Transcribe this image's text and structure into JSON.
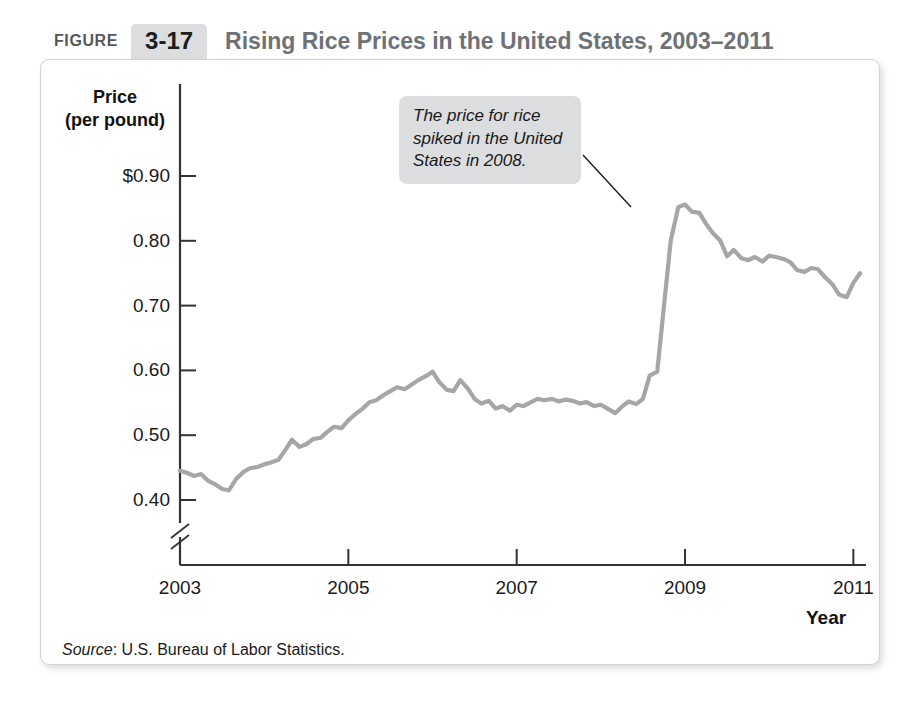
{
  "figure": {
    "label": "FIGURE",
    "number": "3-17",
    "title": "Rising Rice Prices in the United States, 2003–2011"
  },
  "source": {
    "prefix": "Source",
    "text": ": U.S. Bureau of Labor Statistics."
  },
  "annotation": {
    "text": "The price for rice spiked in the United States in 2008."
  },
  "colors": {
    "line": "#a6a6a6",
    "axis": "#333333",
    "title": "#6e7276",
    "badge_bg": "#dcdddf",
    "callout_bg": "#dcdddf",
    "panel_border": "#d2d3d5"
  },
  "chart_data": {
    "type": "line",
    "title": "Rising Rice Prices in the United States, 2003–2011",
    "xlabel": "Year",
    "ylabel": "Price (per pound)",
    "ylabel_line1": "Price",
    "ylabel_line2": "(per pound)",
    "ylim": [
      0.355,
      0.945
    ],
    "xlim": [
      2003.0,
      2011.15
    ],
    "y_ticks": [
      0.4,
      0.5,
      0.6,
      0.7,
      0.8,
      0.9
    ],
    "y_tick_labels": [
      "0.40",
      "0.50",
      "0.60",
      "0.70",
      "0.80",
      "$0.90"
    ],
    "x_ticks": [
      2003,
      2005,
      2007,
      2009,
      2011
    ],
    "x_tick_labels": [
      "2003",
      "2005",
      "2007",
      "2009",
      "2011"
    ],
    "axis_break": true,
    "axis_break_note": "y-axis broken below 0.40",
    "grid": false,
    "legend": "none",
    "series": [
      {
        "name": "Rice price (per pound)",
        "color": "#a6a6a6",
        "x": [
          2003.0,
          2003.08,
          2003.17,
          2003.25,
          2003.33,
          2003.42,
          2003.5,
          2003.58,
          2003.67,
          2003.75,
          2003.83,
          2003.92,
          2004.0,
          2004.08,
          2004.17,
          2004.25,
          2004.33,
          2004.42,
          2004.5,
          2004.58,
          2004.67,
          2004.75,
          2004.83,
          2004.92,
          2005.0,
          2005.08,
          2005.17,
          2005.25,
          2005.33,
          2005.42,
          2005.5,
          2005.58,
          2005.67,
          2005.75,
          2005.83,
          2005.92,
          2006.0,
          2006.08,
          2006.17,
          2006.25,
          2006.33,
          2006.42,
          2006.5,
          2006.58,
          2006.67,
          2006.75,
          2006.83,
          2006.92,
          2007.0,
          2007.08,
          2007.17,
          2007.25,
          2007.33,
          2007.42,
          2007.5,
          2007.58,
          2007.67,
          2007.75,
          2007.83,
          2007.92,
          2008.0,
          2008.08,
          2008.17,
          2008.25,
          2008.33,
          2008.42,
          2008.5,
          2008.58,
          2008.67,
          2008.75,
          2008.83,
          2008.92,
          2009.0,
          2009.08,
          2009.17,
          2009.25,
          2009.33,
          2009.42,
          2009.5,
          2009.58,
          2009.67,
          2009.75,
          2009.83,
          2009.92,
          2010.0,
          2010.08,
          2010.17,
          2010.25,
          2010.33,
          2010.42,
          2010.5,
          2010.58,
          2010.67,
          2010.75,
          2010.83,
          2010.92,
          2011.0,
          2011.08
        ],
        "y": [
          0.445,
          0.442,
          0.437,
          0.44,
          0.43,
          0.424,
          0.417,
          0.415,
          0.433,
          0.443,
          0.449,
          0.451,
          0.455,
          0.458,
          0.462,
          0.477,
          0.493,
          0.482,
          0.486,
          0.494,
          0.496,
          0.505,
          0.513,
          0.511,
          0.523,
          0.532,
          0.541,
          0.551,
          0.554,
          0.562,
          0.568,
          0.574,
          0.571,
          0.578,
          0.585,
          0.591,
          0.598,
          0.582,
          0.57,
          0.568,
          0.585,
          0.572,
          0.556,
          0.549,
          0.553,
          0.541,
          0.545,
          0.538,
          0.547,
          0.545,
          0.551,
          0.556,
          0.554,
          0.556,
          0.552,
          0.555,
          0.553,
          0.549,
          0.551,
          0.545,
          0.547,
          0.541,
          0.534,
          0.544,
          0.552,
          0.548,
          0.556,
          0.592,
          0.598,
          0.7,
          0.8,
          0.852,
          0.856,
          0.845,
          0.843,
          0.826,
          0.812,
          0.8,
          0.776,
          0.786,
          0.773,
          0.77,
          0.775,
          0.768,
          0.777,
          0.775,
          0.772,
          0.767,
          0.755,
          0.752,
          0.758,
          0.756,
          0.743,
          0.733,
          0.717,
          0.713,
          0.735,
          0.75
        ]
      }
    ],
    "annotations": [
      {
        "text": "The price for rice spiked in the United States in 2008.",
        "points_to_x": 2008.83,
        "points_to_y": 0.852
      }
    ]
  }
}
